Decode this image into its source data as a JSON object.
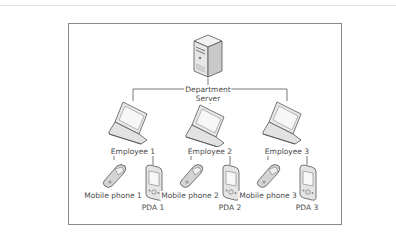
{
  "diagram": {
    "type": "network-hierarchy",
    "root": {
      "id": "server",
      "label_line1": "Department",
      "label_line2": "Server",
      "icon": "server-tower-icon"
    },
    "employees": [
      {
        "label": "Employee 1",
        "icon": "laptop-icon",
        "devices": [
          {
            "label": "Mobile phone 1",
            "icon": "mobile-phone-icon"
          },
          {
            "label": "PDA 1",
            "icon": "pda-icon"
          }
        ]
      },
      {
        "label": "Employee 2",
        "icon": "laptop-icon",
        "devices": [
          {
            "label": "Mobile phone 2",
            "icon": "mobile-phone-icon"
          },
          {
            "label": "PDA 2",
            "icon": "pda-icon"
          }
        ]
      },
      {
        "label": "Employee 3",
        "icon": "laptop-icon",
        "devices": [
          {
            "label": "Mobile phone 3",
            "icon": "mobile-phone-icon"
          },
          {
            "label": "PDA 3",
            "icon": "pda-icon"
          }
        ]
      }
    ],
    "colors": {
      "line": "#555555",
      "frame": "#8a8a8a",
      "text": "#4a4a4a",
      "icon_fill": "#e8e8e8",
      "icon_stroke": "#555555"
    }
  }
}
